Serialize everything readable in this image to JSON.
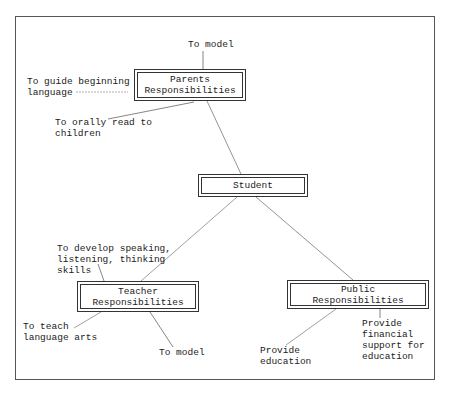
{
  "diagram": {
    "nodes": {
      "parents": {
        "label": "Parents\nResponsibilities"
      },
      "student": {
        "label": "Student"
      },
      "teacher": {
        "label": "Teacher\nResponsibilities"
      },
      "public": {
        "label": "Public\nResponsibilities"
      }
    },
    "annotations": {
      "parents_model": "To model",
      "parents_guide": "To guide beginning\nlanguage",
      "parents_read": "To orally read to\nchildren",
      "teacher_develop": "To develop speaking,\nlistening, thinking\nskills",
      "teacher_teach": "To teach\nlanguage arts",
      "teacher_model": "To model",
      "public_education": "Provide\neducation",
      "public_financial": "Provide\nfinancial\nsupport for\neducation"
    },
    "edges": [
      {
        "from": "parents",
        "to": "student"
      },
      {
        "from": "student",
        "to": "teacher"
      },
      {
        "from": "student",
        "to": "public"
      }
    ],
    "colors": {
      "line": "#777777",
      "border": "#333333",
      "text": "#222222"
    }
  }
}
